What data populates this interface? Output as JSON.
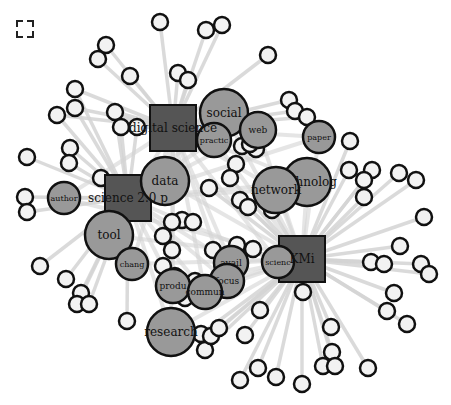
{
  "toolbar": {
    "fullscreen_icon": "fullscreen-icon"
  },
  "colors": {
    "background": "#ffffff",
    "edge": "#d4d4d4",
    "square_fill": "#555555",
    "topic_fill": "#999999",
    "leaf_fill": "#f2f2f2",
    "stroke": "#111111",
    "label": "#111111"
  },
  "hubs": [
    {
      "id": "digital-science",
      "label": "digital science",
      "x": 173,
      "y": 128,
      "size": 46
    },
    {
      "id": "science-2-0",
      "label": "science 2.0 p",
      "x": 128,
      "y": 198,
      "size": 46
    },
    {
      "id": "kmi",
      "label": "KMi",
      "x": 302,
      "y": 259,
      "size": 46
    }
  ],
  "topics": [
    {
      "id": "social",
      "label": "social",
      "x": 224,
      "y": 113,
      "r": 24,
      "fs": 12
    },
    {
      "id": "practic",
      "label": "practic",
      "x": 214,
      "y": 140,
      "r": 17,
      "fs": 8
    },
    {
      "id": "web",
      "label": "web",
      "x": 258,
      "y": 130,
      "r": 18,
      "fs": 9
    },
    {
      "id": "paper",
      "label": "paper",
      "x": 319,
      "y": 137,
      "r": 16,
      "fs": 8
    },
    {
      "id": "technolog",
      "label": "technolog",
      "x": 307,
      "y": 182,
      "r": 24,
      "fs": 12
    },
    {
      "id": "network",
      "label": "network",
      "x": 276,
      "y": 190,
      "r": 23,
      "fs": 12
    },
    {
      "id": "data",
      "label": "data",
      "x": 165,
      "y": 181,
      "r": 24,
      "fs": 12
    },
    {
      "id": "author",
      "label": "author",
      "x": 64,
      "y": 198,
      "r": 16,
      "fs": 8
    },
    {
      "id": "tool",
      "label": "tool",
      "x": 109,
      "y": 235,
      "r": 24,
      "fs": 12
    },
    {
      "id": "chang",
      "label": "chang",
      "x": 132,
      "y": 264,
      "r": 16,
      "fs": 8
    },
    {
      "id": "scienc",
      "label": "scienc",
      "x": 278,
      "y": 262,
      "r": 16,
      "fs": 8
    },
    {
      "id": "avail",
      "label": "avail",
      "x": 231,
      "y": 263,
      "r": 17,
      "fs": 9
    },
    {
      "id": "focus",
      "label": "focus",
      "x": 227,
      "y": 281,
      "r": 17,
      "fs": 9
    },
    {
      "id": "produ",
      "label": "produ",
      "x": 173,
      "y": 286,
      "r": 17,
      "fs": 9
    },
    {
      "id": "commun",
      "label": "commun",
      "x": 205,
      "y": 292,
      "r": 17,
      "fs": 9
    },
    {
      "id": "research",
      "label": "research",
      "x": 171,
      "y": 332,
      "r": 24,
      "fs": 12
    }
  ],
  "leaves": [
    {
      "x": 160,
      "y": 22
    },
    {
      "x": 206,
      "y": 30
    },
    {
      "x": 222,
      "y": 25
    },
    {
      "x": 106,
      "y": 45
    },
    {
      "x": 98,
      "y": 59
    },
    {
      "x": 130,
      "y": 76
    },
    {
      "x": 75,
      "y": 89
    },
    {
      "x": 57,
      "y": 115
    },
    {
      "x": 75,
      "y": 108
    },
    {
      "x": 115,
      "y": 112
    },
    {
      "x": 121,
      "y": 127
    },
    {
      "x": 137,
      "y": 127
    },
    {
      "x": 178,
      "y": 73
    },
    {
      "x": 188,
      "y": 80
    },
    {
      "x": 268,
      "y": 55
    },
    {
      "x": 289,
      "y": 100
    },
    {
      "x": 295,
      "y": 111
    },
    {
      "x": 307,
      "y": 117
    },
    {
      "x": 27,
      "y": 157
    },
    {
      "x": 70,
      "y": 148
    },
    {
      "x": 69,
      "y": 163
    },
    {
      "x": 25,
      "y": 197
    },
    {
      "x": 27,
      "y": 212
    },
    {
      "x": 101,
      "y": 178
    },
    {
      "x": 122,
      "y": 215
    },
    {
      "x": 40,
      "y": 266
    },
    {
      "x": 66,
      "y": 279
    },
    {
      "x": 81,
      "y": 293
    },
    {
      "x": 77,
      "y": 304
    },
    {
      "x": 89,
      "y": 304
    },
    {
      "x": 127,
      "y": 321
    },
    {
      "x": 242,
      "y": 146
    },
    {
      "x": 236,
      "y": 164
    },
    {
      "x": 230,
      "y": 178
    },
    {
      "x": 209,
      "y": 188
    },
    {
      "x": 240,
      "y": 200
    },
    {
      "x": 248,
      "y": 207
    },
    {
      "x": 272,
      "y": 210
    },
    {
      "x": 350,
      "y": 141
    },
    {
      "x": 349,
      "y": 170
    },
    {
      "x": 372,
      "y": 170
    },
    {
      "x": 364,
      "y": 180
    },
    {
      "x": 364,
      "y": 197
    },
    {
      "x": 399,
      "y": 173
    },
    {
      "x": 416,
      "y": 180
    },
    {
      "x": 424,
      "y": 217
    },
    {
      "x": 400,
      "y": 246
    },
    {
      "x": 371,
      "y": 262
    },
    {
      "x": 384,
      "y": 264
    },
    {
      "x": 421,
      "y": 264
    },
    {
      "x": 429,
      "y": 274
    },
    {
      "x": 394,
      "y": 293
    },
    {
      "x": 387,
      "y": 311
    },
    {
      "x": 407,
      "y": 324
    },
    {
      "x": 303,
      "y": 292
    },
    {
      "x": 331,
      "y": 327
    },
    {
      "x": 332,
      "y": 352
    },
    {
      "x": 323,
      "y": 366
    },
    {
      "x": 335,
      "y": 366
    },
    {
      "x": 368,
      "y": 368
    },
    {
      "x": 302,
      "y": 384
    },
    {
      "x": 276,
      "y": 377
    },
    {
      "x": 240,
      "y": 380
    },
    {
      "x": 258,
      "y": 368
    },
    {
      "x": 205,
      "y": 350
    },
    {
      "x": 260,
      "y": 310
    },
    {
      "x": 245,
      "y": 335
    },
    {
      "x": 201,
      "y": 334
    },
    {
      "x": 211,
      "y": 336
    },
    {
      "x": 219,
      "y": 328
    },
    {
      "x": 182,
      "y": 220
    },
    {
      "x": 193,
      "y": 222
    },
    {
      "x": 172,
      "y": 222
    },
    {
      "x": 163,
      "y": 236
    },
    {
      "x": 172,
      "y": 250
    },
    {
      "x": 175,
      "y": 276
    },
    {
      "x": 163,
      "y": 266
    },
    {
      "x": 195,
      "y": 281
    },
    {
      "x": 185,
      "y": 298
    },
    {
      "x": 213,
      "y": 250
    },
    {
      "x": 237,
      "y": 245
    },
    {
      "x": 253,
      "y": 249
    },
    {
      "x": 212,
      "y": 130
    },
    {
      "x": 256,
      "y": 149
    },
    {
      "x": 250,
      "y": 144
    }
  ],
  "edges_from": {
    "digital-science": [
      0,
      1,
      2,
      3,
      4,
      5,
      6,
      7,
      8,
      9,
      10,
      11,
      12,
      13,
      14,
      15,
      16,
      17
    ],
    "science-2-0": [
      18,
      19,
      20,
      21,
      22,
      23,
      24,
      25,
      26,
      27,
      28,
      29,
      30,
      10,
      11,
      9,
      6,
      7,
      8
    ],
    "kmi": [
      38,
      39,
      40,
      41,
      42,
      43,
      44,
      45,
      46,
      47,
      48,
      49,
      50,
      51,
      52,
      53,
      54,
      55,
      56,
      57,
      58,
      59,
      60,
      61,
      62,
      63,
      64,
      65,
      66,
      67,
      68,
      69,
      33,
      34,
      35,
      36,
      37
    ]
  }
}
